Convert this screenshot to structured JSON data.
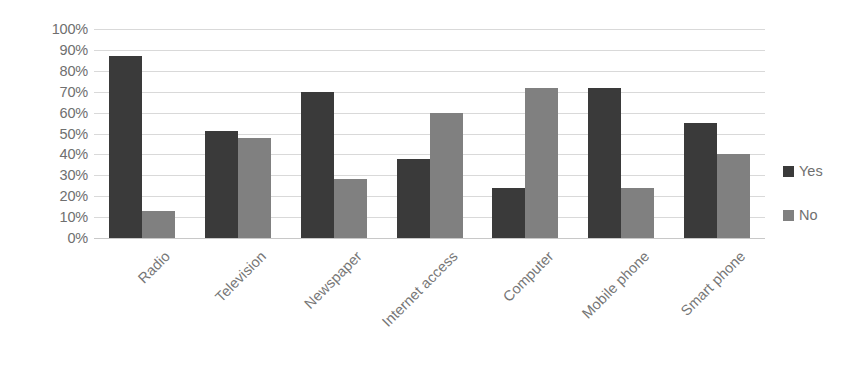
{
  "chart_data": {
    "type": "bar",
    "title": "",
    "xlabel": "",
    "ylabel": "",
    "ylim": [
      0,
      100
    ],
    "y_ticks": [
      "0%",
      "10%",
      "20%",
      "30%",
      "40%",
      "50%",
      "60%",
      "70%",
      "80%",
      "90%",
      "100%"
    ],
    "y_tick_values": [
      0,
      10,
      20,
      30,
      40,
      50,
      60,
      70,
      80,
      90,
      100
    ],
    "grid": true,
    "legend_position": "right",
    "categories": [
      "Radio",
      "Television",
      "Newspaper",
      "Internet access",
      "Computer",
      "Mobile phone",
      "Smart phone"
    ],
    "series": [
      {
        "name": "Yes",
        "color": "#3a3a3a",
        "values": [
          87,
          51,
          70,
          38,
          24,
          72,
          55
        ]
      },
      {
        "name": "No",
        "color": "#808080",
        "values": [
          13,
          48,
          28,
          60,
          72,
          24,
          40
        ]
      }
    ]
  },
  "legend": {
    "items": [
      {
        "label": "Yes",
        "swatch": "legend-swatch-yes"
      },
      {
        "label": "No",
        "swatch": "legend-swatch-no"
      }
    ]
  },
  "colors": {
    "yes": "#3a3a3a",
    "no": "#808080",
    "gridline": "#d9d9d9",
    "axis_text": "#6f6f6f",
    "category_text": "#767676",
    "background": "#ffffff"
  }
}
